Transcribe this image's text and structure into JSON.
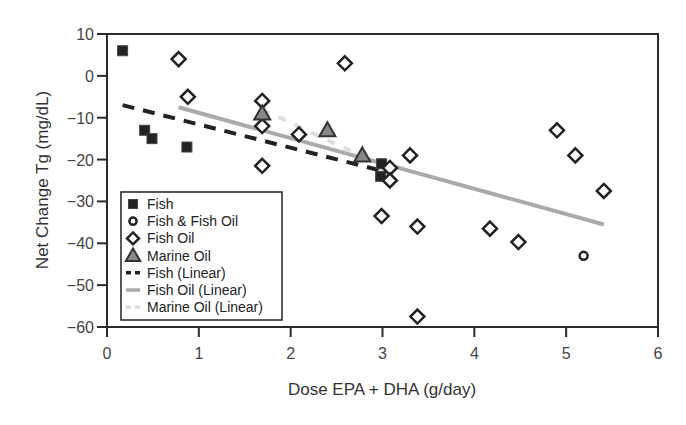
{
  "chart_data": {
    "type": "scatter",
    "title": "",
    "xlabel": "Dose EPA + DHA (g/day)",
    "ylabel": "Net Change Tg (mg/dL)",
    "xlim": [
      0,
      6
    ],
    "ylim": [
      -60,
      10
    ],
    "x_ticks": [
      0,
      1,
      2,
      3,
      4,
      5,
      6
    ],
    "y_ticks": [
      10,
      0,
      -10,
      -20,
      -30,
      -40,
      -50,
      -60
    ],
    "x_tick_labels": [
      "0",
      "1",
      "2",
      "3",
      "4",
      "5",
      "6"
    ],
    "y_tick_labels": [
      "10",
      "0",
      "−10",
      "−20",
      "−30",
      "−40",
      "−50",
      "−60"
    ],
    "grid": false,
    "legend_position": "lower-left inside",
    "series": [
      {
        "name": "Fish",
        "marker": "square",
        "color": "#222222",
        "points": [
          [
            0.17,
            6
          ],
          [
            0.41,
            -13
          ],
          [
            0.49,
            -15
          ],
          [
            0.87,
            -17
          ],
          [
            2.99,
            -21
          ],
          [
            2.98,
            -24
          ]
        ]
      },
      {
        "name": "Fish & Fish Oil",
        "marker": "circle",
        "color": "#222222",
        "points": [
          [
            5.19,
            -43
          ]
        ]
      },
      {
        "name": "Fish Oil",
        "marker": "diamond",
        "color": "#222222",
        "points": [
          [
            0.78,
            4
          ],
          [
            0.88,
            -5
          ],
          [
            1.69,
            -6
          ],
          [
            1.69,
            -12
          ],
          [
            1.69,
            -21.5
          ],
          [
            2.09,
            -14
          ],
          [
            2.59,
            3
          ],
          [
            3.08,
            -22
          ],
          [
            3.08,
            -25
          ],
          [
            3.3,
            -19
          ],
          [
            2.99,
            -33.5
          ],
          [
            3.38,
            -36
          ],
          [
            3.38,
            -57.5
          ],
          [
            4.17,
            -36.5
          ],
          [
            4.48,
            -39.7
          ],
          [
            4.9,
            -13
          ],
          [
            5.1,
            -19
          ],
          [
            5.41,
            -27.5
          ]
        ]
      },
      {
        "name": "Marine Oil",
        "marker": "triangle",
        "color": "#888888",
        "points": [
          [
            1.69,
            -9
          ],
          [
            2.4,
            -13
          ],
          [
            2.78,
            -19
          ]
        ]
      },
      {
        "name": "Fish (Linear)",
        "type": "line",
        "style": "dashed",
        "color": "#222222",
        "points": [
          [
            0.17,
            -7
          ],
          [
            3.05,
            -23
          ]
        ]
      },
      {
        "name": "Fish Oil (Linear)",
        "type": "line",
        "style": "solid",
        "color": "#aaaaaa",
        "points": [
          [
            0.78,
            -7.5
          ],
          [
            5.41,
            -35.5
          ]
        ]
      },
      {
        "name": "Marine Oil (Linear)",
        "type": "line",
        "style": "dashed",
        "color": "#dddddd",
        "points": [
          [
            1.69,
            -8
          ],
          [
            2.95,
            -21
          ]
        ]
      }
    ]
  },
  "legend": {
    "items": [
      {
        "label": "Fish"
      },
      {
        "label": "Fish & Fish Oil"
      },
      {
        "label": "Fish Oil"
      },
      {
        "label": "Marine Oil"
      },
      {
        "label": "Fish (Linear)"
      },
      {
        "label": "Fish Oil (Linear)"
      },
      {
        "label": "Marine Oil (Linear)"
      }
    ]
  }
}
